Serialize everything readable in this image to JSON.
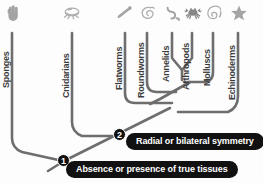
{
  "figure": {
    "background_color": "#fdfdfd",
    "branch_color": "#6e6e6e",
    "label_color": "#3c3c3c",
    "banner_color": "#111111",
    "banner_text_color": "#ffffff"
  },
  "tips": [
    {
      "label": "Sponges",
      "icon": "sponge-icon",
      "x": 12
    },
    {
      "label": "Cnidarians",
      "icon": "jellyfish-icon",
      "x": 72
    },
    {
      "label": "Flatworms",
      "icon": "flatworm-icon",
      "x": 125
    },
    {
      "label": "Roundworms",
      "icon": "roundworm-icon",
      "x": 147
    },
    {
      "label": "Annelids",
      "icon": "annelid-icon",
      "x": 172
    },
    {
      "label": "Arthropods",
      "icon": "crab-icon",
      "x": 192
    },
    {
      "label": "Molluscs",
      "icon": "snail-shell-icon",
      "x": 213
    },
    {
      "label": "Echinoderms",
      "icon": "starfish-icon",
      "x": 238
    }
  ],
  "nodes": [
    {
      "number": "1",
      "label_text": "Absence or presence of true tissues"
    },
    {
      "number": "2",
      "label_text": "Radial or bilateral symmetry"
    }
  ],
  "banners": [
    {
      "text": "Radial or bilateral symmetry"
    },
    {
      "text": "Absence or presence of true tissues"
    }
  ]
}
